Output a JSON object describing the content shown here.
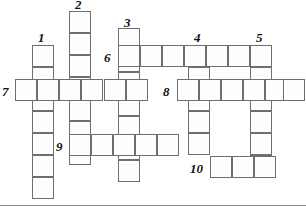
{
  "puzzle": {
    "kind": "crossword-grid",
    "title": "",
    "grid": {
      "cell_size": 22,
      "width": 306,
      "height": 213,
      "line_color": "#6f6f6f",
      "cell_fill": "#fefefe",
      "background": "#ffffff"
    },
    "entries": [
      {
        "number": "1",
        "direction": "down",
        "length": 7,
        "col": 0,
        "row": 0,
        "x": 32,
        "y": 45
      },
      {
        "number": "2",
        "direction": "down",
        "length": 7,
        "col": 0,
        "row": 0,
        "x": 69,
        "y": 11
      },
      {
        "number": "3",
        "direction": "down",
        "length": 6,
        "col": 0,
        "row": 0,
        "x": 118,
        "y": 28
      },
      {
        "number": "4",
        "direction": "down",
        "length": 5,
        "col": 0,
        "row": 0,
        "x": 188,
        "y": 45
      },
      {
        "number": "5",
        "direction": "down",
        "length": 6,
        "col": 0,
        "row": 0,
        "x": 250,
        "y": 45
      },
      {
        "number": "6",
        "direction": "across",
        "length": 7,
        "col": 0,
        "row": 0,
        "x": 118,
        "y": 45
      },
      {
        "number": "7",
        "direction": "across",
        "length": 5,
        "col": 0,
        "row": 0,
        "x": 15,
        "y": 79
      },
      {
        "number": "8",
        "direction": "across",
        "length": 5,
        "col": 0,
        "row": 0,
        "x": 177,
        "y": 79
      },
      {
        "number": "9",
        "direction": "across",
        "length": 5,
        "col": 0,
        "row": 0,
        "x": 69,
        "y": 134
      },
      {
        "number": "10",
        "direction": "across",
        "length": 3,
        "col": 0,
        "row": 0,
        "x": 206,
        "y": 156
      }
    ],
    "cells": [
      {
        "name": "cell-1d-1",
        "x": 32,
        "y": 45
      },
      {
        "name": "cell-1d-2",
        "x": 32,
        "y": 67
      },
      {
        "name": "cell-1d-3",
        "x": 32,
        "y": 89
      },
      {
        "name": "cell-1d-4",
        "x": 32,
        "y": 111
      },
      {
        "name": "cell-1d-5",
        "x": 32,
        "y": 133
      },
      {
        "name": "cell-1d-6",
        "x": 32,
        "y": 155
      },
      {
        "name": "cell-1d-7",
        "x": 32,
        "y": 177
      },
      {
        "name": "cell-2d-1",
        "x": 69,
        "y": 11
      },
      {
        "name": "cell-2d-2",
        "x": 69,
        "y": 33
      },
      {
        "name": "cell-2d-3",
        "x": 69,
        "y": 55
      },
      {
        "name": "cell-2d-4",
        "x": 69,
        "y": 77
      },
      {
        "name": "cell-2d-5",
        "x": 69,
        "y": 99
      },
      {
        "name": "cell-2d-6",
        "x": 69,
        "y": 121
      },
      {
        "name": "cell-2d-7",
        "x": 69,
        "y": 143
      },
      {
        "name": "cell-3d-1",
        "x": 118,
        "y": 28
      },
      {
        "name": "cell-3d-2",
        "x": 118,
        "y": 50
      },
      {
        "name": "cell-3d-3",
        "x": 118,
        "y": 72
      },
      {
        "name": "cell-3d-4",
        "x": 118,
        "y": 94
      },
      {
        "name": "cell-3d-5",
        "x": 118,
        "y": 116
      },
      {
        "name": "cell-3d-6",
        "x": 118,
        "y": 138
      },
      {
        "name": "cell-3d-7",
        "x": 118,
        "y": 160
      },
      {
        "name": "cell-4d-1",
        "x": 188,
        "y": 45
      },
      {
        "name": "cell-4d-2",
        "x": 188,
        "y": 67
      },
      {
        "name": "cell-4d-3",
        "x": 188,
        "y": 89
      },
      {
        "name": "cell-4d-4",
        "x": 188,
        "y": 111
      },
      {
        "name": "cell-4d-5",
        "x": 188,
        "y": 133
      },
      {
        "name": "cell-5d-1",
        "x": 250,
        "y": 45
      },
      {
        "name": "cell-5d-2",
        "x": 250,
        "y": 67
      },
      {
        "name": "cell-5d-3",
        "x": 250,
        "y": 89
      },
      {
        "name": "cell-5d-4",
        "x": 250,
        "y": 111
      },
      {
        "name": "cell-5d-5",
        "x": 250,
        "y": 133
      },
      {
        "name": "cell-5d-6",
        "x": 250,
        "y": 155
      },
      {
        "name": "cell-6a-1",
        "x": 118,
        "y": 45
      },
      {
        "name": "cell-6a-2",
        "x": 140,
        "y": 45
      },
      {
        "name": "cell-6a-3",
        "x": 162,
        "y": 45
      },
      {
        "name": "cell-6a-4",
        "x": 184,
        "y": 45
      },
      {
        "name": "cell-6a-5",
        "x": 206,
        "y": 45
      },
      {
        "name": "cell-6a-6",
        "x": 228,
        "y": 45
      },
      {
        "name": "cell-6a-7",
        "x": 250,
        "y": 45
      },
      {
        "name": "cell-7a-1",
        "x": 15,
        "y": 79
      },
      {
        "name": "cell-7a-2",
        "x": 37,
        "y": 79
      },
      {
        "name": "cell-7a-3",
        "x": 59,
        "y": 79
      },
      {
        "name": "cell-7a-4",
        "x": 81,
        "y": 79
      },
      {
        "name": "cell-7a-5",
        "x": 104,
        "y": 79
      },
      {
        "name": "cell-7a-6",
        "x": 126,
        "y": 79
      },
      {
        "name": "cell-8a-1",
        "x": 177,
        "y": 79
      },
      {
        "name": "cell-8a-2",
        "x": 199,
        "y": 79
      },
      {
        "name": "cell-8a-3",
        "x": 221,
        "y": 79
      },
      {
        "name": "cell-8a-4",
        "x": 243,
        "y": 79
      },
      {
        "name": "cell-8a-5",
        "x": 265,
        "y": 79
      },
      {
        "name": "cell-8a-6",
        "x": 283,
        "y": 79
      },
      {
        "name": "cell-9a-1",
        "x": 69,
        "y": 134
      },
      {
        "name": "cell-9a-2",
        "x": 91,
        "y": 134
      },
      {
        "name": "cell-9a-3",
        "x": 113,
        "y": 134
      },
      {
        "name": "cell-9a-4",
        "x": 135,
        "y": 134
      },
      {
        "name": "cell-9a-5",
        "x": 157,
        "y": 134
      },
      {
        "name": "cell-10a-1",
        "x": 210,
        "y": 156
      },
      {
        "name": "cell-10a-2",
        "x": 232,
        "y": 156
      },
      {
        "name": "cell-10a-3",
        "x": 254,
        "y": 156
      }
    ],
    "numbers": [
      {
        "label": "1",
        "x": 38,
        "y": 31
      },
      {
        "label": "2",
        "x": 75,
        "y": -2
      },
      {
        "label": "3",
        "x": 124,
        "y": 16
      },
      {
        "label": "4",
        "x": 194,
        "y": 31
      },
      {
        "label": "5",
        "x": 256,
        "y": 31
      },
      {
        "label": "6",
        "x": 104,
        "y": 51
      },
      {
        "label": "7",
        "x": 2,
        "y": 85
      },
      {
        "label": "8",
        "x": 163,
        "y": 85
      },
      {
        "label": "9",
        "x": 56,
        "y": 140
      },
      {
        "label": "10",
        "x": 190,
        "y": 162
      }
    ]
  }
}
